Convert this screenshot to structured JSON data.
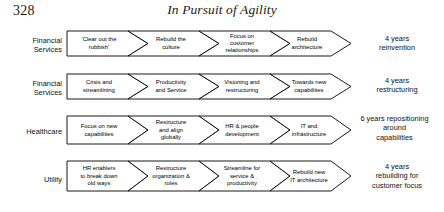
{
  "page": {
    "folio": "328",
    "running_head": "In Pursuit of Agility"
  },
  "figure": {
    "rows": [
      {
        "label": "Financial\nServices",
        "label_line1": "Financial",
        "label_line2": "Services",
        "stages": [
          {
            "lines": [
              "'Clear out the",
              "rubbish'"
            ]
          },
          {
            "lines": [
              "Rebuild the",
              "culture"
            ]
          },
          {
            "lines": [
              "Focus on",
              "customer",
              "relationships"
            ]
          },
          {
            "lines": [
              "Rebuild",
              "architecture"
            ]
          }
        ],
        "outcome_lines": [
          "4 years",
          "reinvention"
        ]
      },
      {
        "label_line1": "Financial",
        "label_line2": "Services",
        "stages": [
          {
            "lines": [
              "Crisis and",
              "streamlining"
            ]
          },
          {
            "lines": [
              "Productivity",
              "and Service"
            ]
          },
          {
            "lines": [
              "Visioning and",
              "restructuring"
            ]
          },
          {
            "lines": [
              "Towards new",
              "capabilities"
            ]
          }
        ],
        "outcome_lines": [
          "4 years",
          "restructuring"
        ]
      },
      {
        "label_line1": "Healthcare",
        "label_line2": "",
        "stages": [
          {
            "lines": [
              "Focus on new",
              "capabilities"
            ]
          },
          {
            "lines": [
              "Restructure",
              "and align",
              "globally"
            ]
          },
          {
            "lines": [
              "HR & people",
              "development"
            ]
          },
          {
            "lines": [
              "IT and",
              "infrastructure"
            ]
          }
        ],
        "outcome_lines": [
          "6 years repositioning",
          "around",
          "capabilities"
        ]
      },
      {
        "label_line1": "Utility",
        "label_line2": "",
        "stages": [
          {
            "lines": [
              "HR enablers",
              "to break down",
              "old ways"
            ]
          },
          {
            "lines": [
              "Restructure",
              "organization &",
              "roles"
            ]
          },
          {
            "lines": [
              "Streamline for",
              "service &",
              "productivity"
            ]
          },
          {
            "lines": [
              "Rebuild new",
              "IT architecture"
            ]
          }
        ],
        "outcome_lines": [
          "4 years",
          "rebuilding for",
          "customer focus"
        ]
      }
    ]
  },
  "style": {
    "stroke": "#000000",
    "fill": "#ffffff",
    "text": "#111111"
  }
}
